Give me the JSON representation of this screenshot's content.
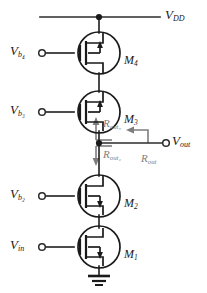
{
  "figure": {
    "kind": "circuit-schematic",
    "colors": {
      "wire": "#2b2b2b",
      "device": "#1a1a1a",
      "annotation": "#7d7d7d",
      "background": "#ffffff"
    }
  },
  "supply": {
    "label_main": "V",
    "label_sub": "DD",
    "name": "vdd-rail"
  },
  "ground": {
    "name": "ground-symbol"
  },
  "output": {
    "label_main": "V",
    "label_sub": "out",
    "terminal": "open-circle"
  },
  "transistors": [
    {
      "id": "M4",
      "label_main": "M",
      "label_sub": "4",
      "gate_main": "V",
      "gate_sub": "b₄",
      "gate_sub_plain": "b4",
      "type": "nmos",
      "position": "top"
    },
    {
      "id": "M3",
      "label_main": "M",
      "label_sub": "3",
      "gate_main": "V",
      "gate_sub": "b₃",
      "gate_sub_plain": "b3",
      "type": "nmos",
      "position": "upper-middle"
    },
    {
      "id": "M2",
      "label_main": "M",
      "label_sub": "2",
      "gate_main": "V",
      "gate_sub": "b₂",
      "gate_sub_plain": "b2",
      "type": "nmos",
      "position": "lower-middle"
    },
    {
      "id": "M1",
      "label_main": "M",
      "label_sub": "1",
      "gate_main": "V",
      "gate_sub": "in",
      "gate_sub_plain": "in",
      "type": "nmos",
      "position": "bottom"
    }
  ],
  "annotations": [
    {
      "id": "rout3",
      "label_main": "R",
      "label_sub": "out₃",
      "label_sub_plain": "out3",
      "arrow": "up",
      "meaning": "resistance looking up into M3/M4"
    },
    {
      "id": "rout2",
      "label_main": "R",
      "label_sub": "out₂",
      "label_sub_plain": "out2",
      "arrow": "down",
      "meaning": "resistance looking down into M2/M1"
    },
    {
      "id": "rout",
      "label_main": "R",
      "label_sub": "out",
      "label_sub_plain": "out",
      "arrow": "left",
      "meaning": "total output resistance at the output node"
    }
  ]
}
